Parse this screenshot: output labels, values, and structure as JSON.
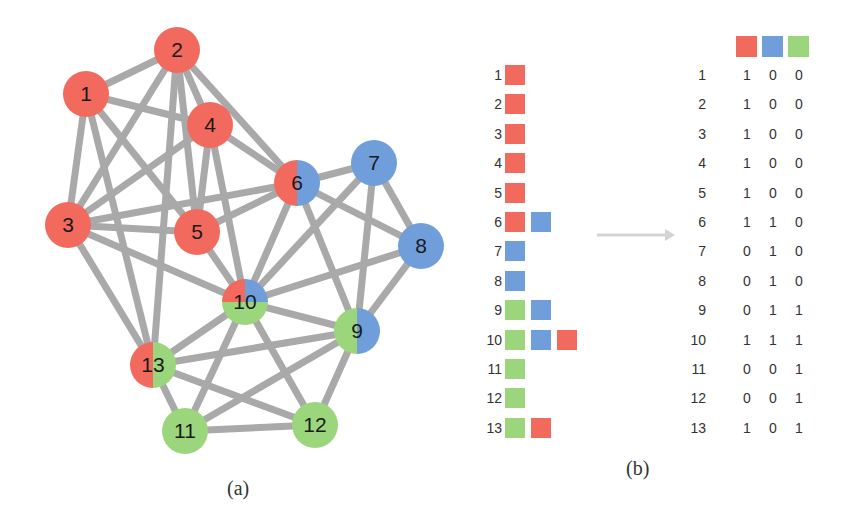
{
  "colors": {
    "red": "#f26a5e",
    "blue": "#6f9edb",
    "green": "#9bd67c",
    "edge": "#a9a9a9",
    "arrow": "#d0d0d0"
  },
  "panel_a": {
    "caption": "(a)",
    "nodes": [
      {
        "id": "1",
        "x": 86,
        "y": 94,
        "communities": [
          "red"
        ]
      },
      {
        "id": "2",
        "x": 177,
        "y": 50,
        "communities": [
          "red"
        ]
      },
      {
        "id": "3",
        "x": 68,
        "y": 225,
        "communities": [
          "red"
        ]
      },
      {
        "id": "4",
        "x": 210,
        "y": 125,
        "communities": [
          "red"
        ]
      },
      {
        "id": "5",
        "x": 197,
        "y": 232,
        "communities": [
          "red"
        ]
      },
      {
        "id": "6",
        "x": 297,
        "y": 183,
        "communities": [
          "red",
          "blue"
        ]
      },
      {
        "id": "7",
        "x": 374,
        "y": 163,
        "communities": [
          "blue"
        ]
      },
      {
        "id": "8",
        "x": 421,
        "y": 246,
        "communities": [
          "blue"
        ]
      },
      {
        "id": "9",
        "x": 357,
        "y": 331,
        "communities": [
          "green",
          "blue"
        ]
      },
      {
        "id": "10",
        "x": 245,
        "y": 302,
        "communities": [
          "red",
          "blue",
          "green"
        ]
      },
      {
        "id": "11",
        "x": 185,
        "y": 431,
        "communities": [
          "green"
        ]
      },
      {
        "id": "12",
        "x": 315,
        "y": 425,
        "communities": [
          "green"
        ]
      },
      {
        "id": "13",
        "x": 153,
        "y": 365,
        "communities": [
          "red",
          "green"
        ]
      }
    ],
    "edges": [
      [
        "1",
        "2"
      ],
      [
        "1",
        "3"
      ],
      [
        "1",
        "4"
      ],
      [
        "1",
        "5"
      ],
      [
        "1",
        "13"
      ],
      [
        "2",
        "3"
      ],
      [
        "2",
        "4"
      ],
      [
        "2",
        "5"
      ],
      [
        "2",
        "6"
      ],
      [
        "2",
        "13"
      ],
      [
        "3",
        "4"
      ],
      [
        "3",
        "5"
      ],
      [
        "3",
        "6"
      ],
      [
        "3",
        "10"
      ],
      [
        "3",
        "13"
      ],
      [
        "4",
        "5"
      ],
      [
        "4",
        "6"
      ],
      [
        "4",
        "10"
      ],
      [
        "5",
        "6"
      ],
      [
        "5",
        "10"
      ],
      [
        "6",
        "7"
      ],
      [
        "6",
        "8"
      ],
      [
        "6",
        "9"
      ],
      [
        "6",
        "10"
      ],
      [
        "7",
        "8"
      ],
      [
        "7",
        "9"
      ],
      [
        "7",
        "10"
      ],
      [
        "8",
        "9"
      ],
      [
        "8",
        "10"
      ],
      [
        "9",
        "10"
      ],
      [
        "9",
        "11"
      ],
      [
        "9",
        "12"
      ],
      [
        "9",
        "13"
      ],
      [
        "10",
        "11"
      ],
      [
        "10",
        "12"
      ],
      [
        "10",
        "13"
      ],
      [
        "11",
        "12"
      ],
      [
        "11",
        "13"
      ],
      [
        "12",
        "13"
      ]
    ]
  },
  "panel_b": {
    "caption": "(b)",
    "membership_list": [
      {
        "id": "1",
        "swatches": [
          "red"
        ]
      },
      {
        "id": "2",
        "swatches": [
          "red"
        ]
      },
      {
        "id": "3",
        "swatches": [
          "red"
        ]
      },
      {
        "id": "4",
        "swatches": [
          "red"
        ]
      },
      {
        "id": "5",
        "swatches": [
          "red"
        ]
      },
      {
        "id": "6",
        "swatches": [
          "red",
          "blue"
        ]
      },
      {
        "id": "7",
        "swatches": [
          "blue"
        ]
      },
      {
        "id": "8",
        "swatches": [
          "blue"
        ]
      },
      {
        "id": "9",
        "swatches": [
          "green",
          "blue"
        ]
      },
      {
        "id": "10",
        "swatches": [
          "green",
          "blue",
          "red"
        ]
      },
      {
        "id": "11",
        "swatches": [
          "green"
        ]
      },
      {
        "id": "12",
        "swatches": [
          "green"
        ]
      },
      {
        "id": "13",
        "swatches": [
          "green",
          "red"
        ]
      }
    ],
    "matrix_header": [
      "red",
      "blue",
      "green"
    ],
    "matrix": [
      {
        "id": "1",
        "values": [
          "1",
          "0",
          "0"
        ]
      },
      {
        "id": "2",
        "values": [
          "1",
          "0",
          "0"
        ]
      },
      {
        "id": "3",
        "values": [
          "1",
          "0",
          "0"
        ]
      },
      {
        "id": "4",
        "values": [
          "1",
          "0",
          "0"
        ]
      },
      {
        "id": "5",
        "values": [
          "1",
          "0",
          "0"
        ]
      },
      {
        "id": "6",
        "values": [
          "1",
          "1",
          "0"
        ]
      },
      {
        "id": "7",
        "values": [
          "0",
          "1",
          "0"
        ]
      },
      {
        "id": "8",
        "values": [
          "0",
          "1",
          "0"
        ]
      },
      {
        "id": "9",
        "values": [
          "0",
          "1",
          "1"
        ]
      },
      {
        "id": "10",
        "values": [
          "1",
          "1",
          "1"
        ]
      },
      {
        "id": "11",
        "values": [
          "0",
          "0",
          "1"
        ]
      },
      {
        "id": "12",
        "values": [
          "0",
          "0",
          "1"
        ]
      },
      {
        "id": "13",
        "values": [
          "1",
          "0",
          "1"
        ]
      }
    ]
  }
}
